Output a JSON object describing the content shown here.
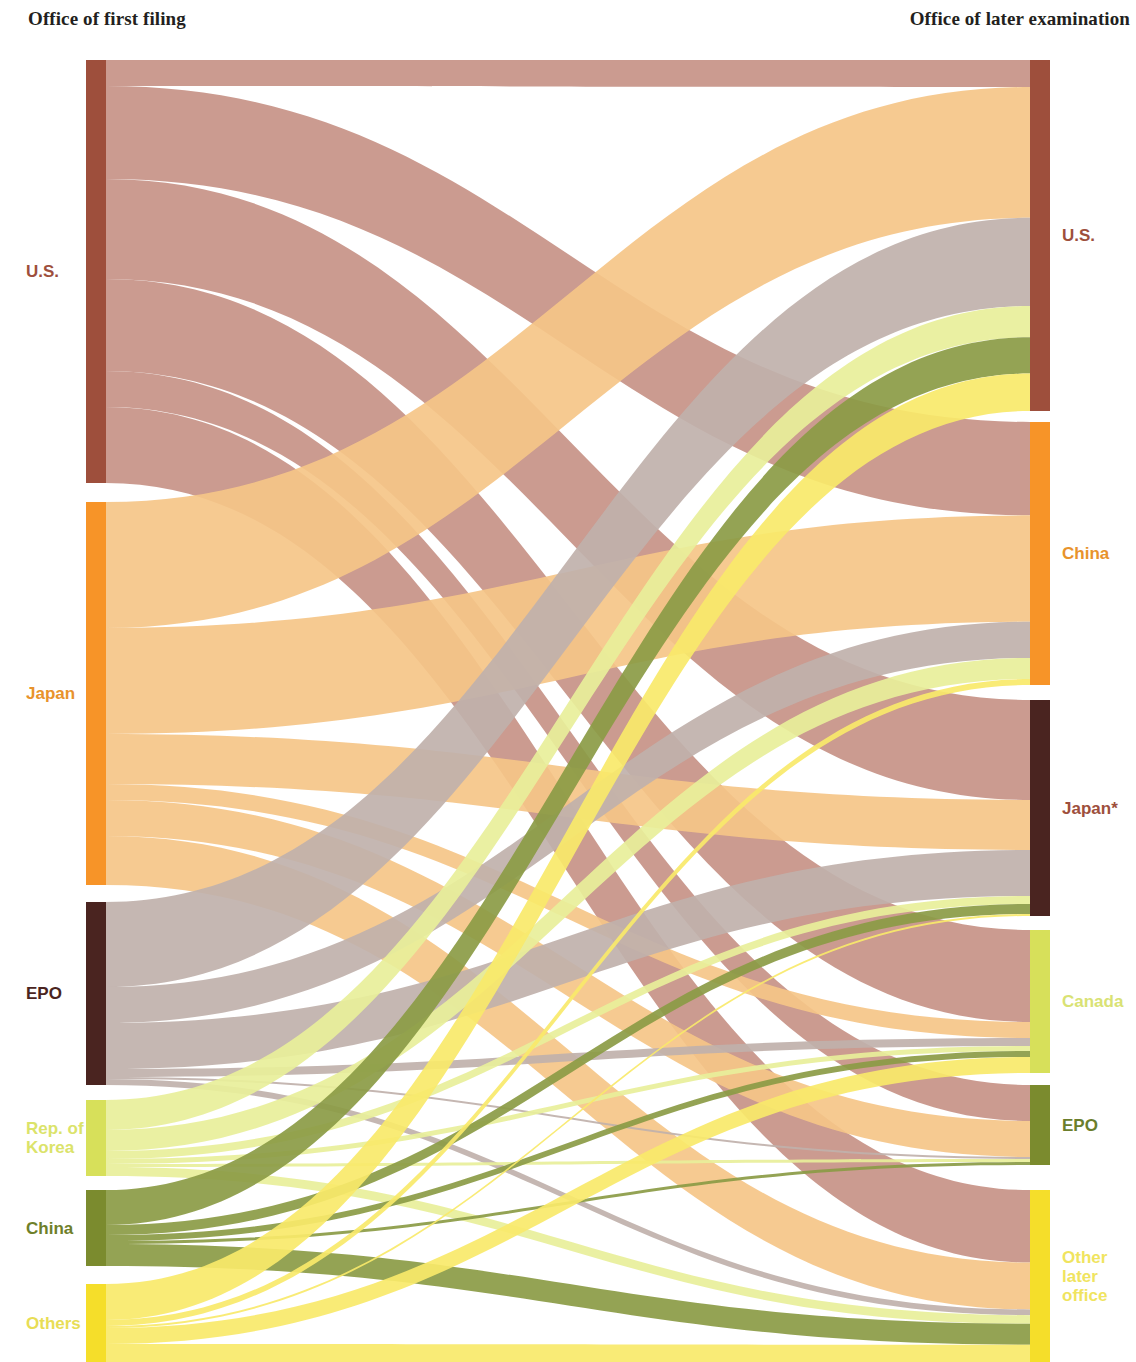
{
  "header": {
    "left_title": "Office of first filing",
    "right_title": "Office of later examination"
  },
  "palette": {
    "us": "#a8563f",
    "us_node": "#9e4f3c",
    "japan": "#f79428",
    "epo": "#4a2420",
    "korea": "#d7e05a",
    "china": "#7b8b2e",
    "others": "#f5de2a",
    "canada": "#d7e05a",
    "flow_us": "#c79287",
    "flow_japan": "#f5c588",
    "flow_epo": "#c0b1ab",
    "flow_korea": "#e8ef9a",
    "flow_china": "#8b9b45",
    "flow_others": "#f8e96a",
    "label_us": "#9e4f3c",
    "label_japan": "#e8932c",
    "label_epo": "#4a2420",
    "label_korea": "#dbe36a",
    "label_china": "#6f7f2a",
    "label_others": "#e8dd55",
    "label_canada": "#d9e274",
    "label_epo_right": "#6b7e2c",
    "label_other_right": "#f0e45f"
  },
  "left_nodes": [
    {
      "id": "us",
      "label": "U.S.",
      "color": "#9e4f3c",
      "label_color": "#9e4f3c",
      "y0": 60,
      "y1": 483
    },
    {
      "id": "japan",
      "label": "Japan",
      "color": "#f79428",
      "label_color": "#e8932c",
      "y0": 502,
      "y1": 885
    },
    {
      "id": "epo",
      "label": "EPO",
      "color": "#4a2420",
      "label_color": "#4a2420",
      "y0": 902,
      "y1": 1085
    },
    {
      "id": "korea",
      "label": "Rep. of\nKorea",
      "color": "#d7e05a",
      "label_color": "#dbe36a",
      "y0": 1100,
      "y1": 1176
    },
    {
      "id": "china",
      "label": "China",
      "color": "#7b8b2e",
      "label_color": "#6f7f2a",
      "y0": 1190,
      "y1": 1266
    },
    {
      "id": "others",
      "label": "Others",
      "color": "#f5de2a",
      "label_color": "#e8dd55",
      "y0": 1284,
      "y1": 1362
    }
  ],
  "right_nodes": [
    {
      "id": "r_us",
      "label": "U.S.",
      "color": "#9e4f3c",
      "label_color": "#9e4f3c",
      "y0": 60,
      "y1": 411
    },
    {
      "id": "r_china",
      "label": "China",
      "color": "#f79428",
      "label_color": "#e8932c",
      "y0": 422,
      "y1": 685
    },
    {
      "id": "r_japan",
      "label": "Japan*",
      "color": "#4a2420",
      "label_color": "#9e4f3c",
      "y0": 700,
      "y1": 916
    },
    {
      "id": "r_canada",
      "label": "Canada",
      "color": "#d7e05a",
      "label_color": "#d9e274",
      "y0": 930,
      "y1": 1073
    },
    {
      "id": "r_epo",
      "label": "EPO",
      "color": "#7b8b2e",
      "label_color": "#6b7e2c",
      "y0": 1085,
      "y1": 1165
    },
    {
      "id": "r_other",
      "label": "Other\nlater\noffice",
      "color": "#f5de2a",
      "label_color": "#f0e45f",
      "y0": 1190,
      "y1": 1362
    }
  ],
  "chart_data": {
    "type": "sankey",
    "title": "",
    "xlabel": "",
    "ylabel": "",
    "source_label": "Office of first filing",
    "target_label": "Office of later examination",
    "sources": [
      "U.S.",
      "Japan",
      "EPO",
      "Rep. of Korea",
      "China",
      "Others"
    ],
    "targets": [
      "U.S.",
      "China",
      "Japan*",
      "Canada",
      "EPO",
      "Other later office"
    ],
    "note": "Japan* carries an asterisk footnote marker",
    "links": [
      {
        "source": "U.S.",
        "target": "U.S.",
        "value": 26
      },
      {
        "source": "U.S.",
        "target": "China",
        "value": 93
      },
      {
        "source": "U.S.",
        "target": "Japan*",
        "value": 100
      },
      {
        "source": "U.S.",
        "target": "Canada",
        "value": 92
      },
      {
        "source": "U.S.",
        "target": "EPO",
        "value": 36
      },
      {
        "source": "U.S.",
        "target": "Other later office",
        "value": 76
      },
      {
        "source": "Japan",
        "target": "U.S.",
        "value": 126
      },
      {
        "source": "Japan",
        "target": "China",
        "value": 106
      },
      {
        "source": "Japan",
        "target": "Japan*",
        "value": 50
      },
      {
        "source": "Japan",
        "target": "Canada",
        "value": 16
      },
      {
        "source": "Japan",
        "target": "EPO",
        "value": 36
      },
      {
        "source": "Japan",
        "target": "Other later office",
        "value": 49
      },
      {
        "source": "EPO",
        "target": "U.S.",
        "value": 85
      },
      {
        "source": "EPO",
        "target": "China",
        "value": 36
      },
      {
        "source": "EPO",
        "target": "Japan*",
        "value": 46
      },
      {
        "source": "EPO",
        "target": "Canada",
        "value": 8
      },
      {
        "source": "EPO",
        "target": "EPO",
        "value": 2
      },
      {
        "source": "EPO",
        "target": "Other later office",
        "value": 6
      },
      {
        "source": "Rep. of Korea",
        "target": "U.S.",
        "value": 30
      },
      {
        "source": "Rep. of Korea",
        "target": "China",
        "value": 21
      },
      {
        "source": "Rep. of Korea",
        "target": "Japan*",
        "value": 8
      },
      {
        "source": "Rep. of Korea",
        "target": "Canada",
        "value": 5
      },
      {
        "source": "Rep. of Korea",
        "target": "EPO",
        "value": 3
      },
      {
        "source": "Rep. of Korea",
        "target": "Other later office",
        "value": 9
      },
      {
        "source": "China",
        "target": "U.S.",
        "value": 35
      },
      {
        "source": "China",
        "target": "China",
        "value": 0
      },
      {
        "source": "China",
        "target": "Japan*",
        "value": 10
      },
      {
        "source": "China",
        "target": "Canada",
        "value": 6
      },
      {
        "source": "China",
        "target": "EPO",
        "value": 3
      },
      {
        "source": "China",
        "target": "Other later office",
        "value": 22
      },
      {
        "source": "Others",
        "target": "U.S.",
        "value": 36
      },
      {
        "source": "Others",
        "target": "China",
        "value": 6
      },
      {
        "source": "Others",
        "target": "Japan*",
        "value": 2
      },
      {
        "source": "Others",
        "target": "Canada",
        "value": 16
      },
      {
        "source": "Others",
        "target": "EPO",
        "value": 0
      },
      {
        "source": "Others",
        "target": "Other later office",
        "value": 18
      }
    ]
  }
}
